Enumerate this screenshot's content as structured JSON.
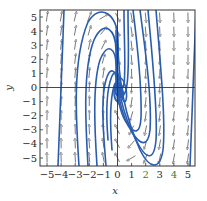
{
  "chart_data": {
    "type": "streamplot",
    "title": "",
    "xlabel": "x",
    "ylabel": "y",
    "xlim": [
      -5.5,
      5.5
    ],
    "ylim": [
      -5.5,
      5.5
    ],
    "xticks": [
      -5,
      -4,
      -3,
      -2,
      -1,
      0,
      1,
      2,
      3,
      4,
      5
    ],
    "yticks": [
      -5,
      -4,
      -3,
      -2,
      -1,
      0,
      1,
      2,
      3,
      4,
      5
    ],
    "xtick_labels": [
      "−5",
      "−4",
      "−3",
      "−2",
      "−1",
      "0",
      "1",
      "2",
      "3",
      "4",
      "5"
    ],
    "ytick_labels": [
      "−5",
      "−4",
      "−3",
      "−2",
      "−1",
      "0",
      "1",
      "2",
      "3",
      "4",
      "5"
    ],
    "grid": false,
    "zero_lines": true,
    "equilibrium": {
      "x": 0,
      "y": 0,
      "type": "spiral sink"
    },
    "arrow_field": {
      "columns_x": [
        -5,
        -4,
        -3,
        -2,
        -1,
        0,
        1,
        2,
        3,
        4,
        5
      ],
      "rows_y": [
        -5,
        -4,
        -3,
        -2,
        -1,
        0,
        1,
        2,
        3,
        4,
        5
      ],
      "left_direction": "down",
      "right_direction": "up"
    },
    "colors": {
      "trajectory": "#2a5db0",
      "arrow": "#555555",
      "axis": "#333333",
      "frame": "#333333"
    }
  },
  "labels": {
    "x_axis": "x",
    "y_axis": "y"
  }
}
